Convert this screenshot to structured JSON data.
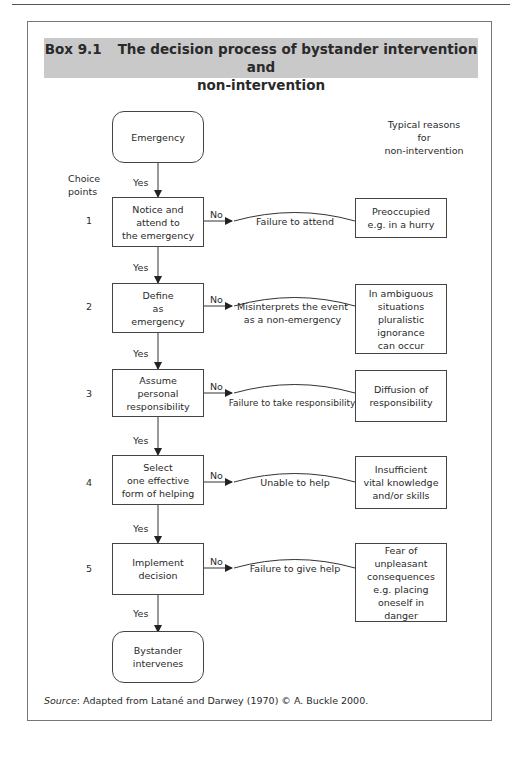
{
  "box": {
    "number": "Box 9.1",
    "title_line1": "The decision process of bystander intervention and",
    "title_line2": "non-intervention"
  },
  "headers": {
    "choice_points": [
      "Choice",
      "points"
    ],
    "typical_reasons": [
      "Typical reasons",
      "for",
      "non-intervention"
    ]
  },
  "start": {
    "label": "Emergency"
  },
  "end": {
    "label_lines": [
      "Bystander",
      "intervenes"
    ]
  },
  "yes_label": "Yes",
  "no_label": "No",
  "steps": [
    {
      "num": "1",
      "lines": [
        "Notice and",
        "attend to",
        "the emergency"
      ],
      "failure": [
        "Failure to attend"
      ],
      "reason": [
        "Preoccupied",
        "e.g. in a hurry"
      ]
    },
    {
      "num": "2",
      "lines": [
        "Define",
        "as",
        "emergency"
      ],
      "failure": [
        "Misinterprets the event",
        "as a non-emergency"
      ],
      "reason": [
        "In ambiguous",
        "situations",
        "pluralistic",
        "ignorance",
        "can occur"
      ]
    },
    {
      "num": "3",
      "lines": [
        "Assume",
        "personal",
        "responsibility"
      ],
      "failure": [
        "Failure to take responsibility"
      ],
      "reason": [
        "Diffusion of",
        "responsibility"
      ]
    },
    {
      "num": "4",
      "lines": [
        "Select",
        "one effective",
        "form of helping"
      ],
      "failure": [
        "Unable to help"
      ],
      "reason": [
        "Insufficient",
        "vital knowledge",
        "and/or skills"
      ]
    },
    {
      "num": "5",
      "lines": [
        "Implement",
        "decision"
      ],
      "failure": [
        "Failure to give help"
      ],
      "reason": [
        "Fear of",
        "unpleasant",
        "consequences",
        "e.g. placing",
        "oneself in",
        "danger"
      ]
    }
  ],
  "source": {
    "prefix": "Source",
    "text": ": Adapted from Latané and Darwey (1970) © A. Buckle 2000."
  }
}
